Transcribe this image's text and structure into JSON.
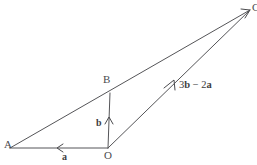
{
  "figure": {
    "type": "vector-geometry-diagram",
    "background_color": "#ffffff",
    "line_color": "#555558",
    "text_color": "#4b4b4e",
    "width": 257,
    "height": 165
  },
  "points": {
    "A": {
      "label": "A",
      "x": 10,
      "y": 148
    },
    "O": {
      "label": "O",
      "x": 108,
      "y": 148
    },
    "B": {
      "label": "B",
      "x": 110,
      "y": 93
    },
    "C": {
      "label": "C",
      "x": 250,
      "y": 10
    }
  },
  "vectors": {
    "a": {
      "label": "a",
      "from": "O",
      "to": "A",
      "arrow_direction": "left",
      "label_x": 62,
      "label_y": 152
    },
    "b": {
      "label": "b",
      "from": "O",
      "to": "B",
      "arrow_direction": "up",
      "label_x": 96,
      "label_y": 118
    },
    "resultant": {
      "label": "3b − 2a",
      "label_parts": {
        "coef1": "3",
        "unit1": "b",
        "operator": "−",
        "coef2": "2",
        "unit2": "a"
      },
      "from": "O",
      "to": "C",
      "arrow_direction": "up-right",
      "label_x": 179,
      "label_y": 80
    }
  },
  "segments": [
    {
      "name": "segment-A-O",
      "from": "A",
      "to": "O"
    },
    {
      "name": "segment-A-C",
      "from": "A",
      "to": "C",
      "passes_through": "B"
    },
    {
      "name": "segment-O-B",
      "from": "O",
      "to": "B"
    },
    {
      "name": "segment-O-C",
      "from": "O",
      "to": "C"
    }
  ],
  "point_labels": {
    "A": {
      "text": "A",
      "x": 4,
      "y": 140
    },
    "O": {
      "text": "O",
      "x": 104,
      "y": 150
    },
    "B": {
      "text": "B",
      "x": 103,
      "y": 74
    },
    "C": {
      "text": "C",
      "x": 252,
      "y": 2
    }
  }
}
